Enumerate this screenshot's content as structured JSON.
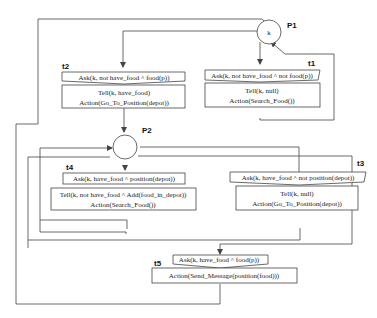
{
  "places": [
    {
      "id": "P1",
      "label": "P1",
      "token": "k"
    },
    {
      "id": "P2",
      "label": "P2",
      "token": ""
    }
  ],
  "transitions": [
    {
      "id": "t1",
      "label": "t1",
      "ask": "Ask(k, not have_food ^ not food(p))",
      "tell": "Tell(k, null)",
      "action": "Action(Search_Food())"
    },
    {
      "id": "t2",
      "label": "t2",
      "ask": "Ask(k, not have_food ^ food(p))",
      "tell": "Tell(k, have_food)",
      "action": "Action(Go_To_Position(depot))"
    },
    {
      "id": "t3",
      "label": "t3",
      "ask": "Ask(k, have_food ^ not position(depot))",
      "tell": "Tell(k, null)",
      "action": "Action(Go_To_Position(depot))"
    },
    {
      "id": "t4",
      "label": "t4",
      "ask": "Ask(k, have_food ^ position(depot))",
      "tell": "Tell(k, not have_food ^ Add(food_in_depot))",
      "action": "Action(Search_Food())"
    },
    {
      "id": "t5",
      "label": "t5",
      "ask": "Ask(k, have_food ^ food(p))",
      "tell": "",
      "action": "Action(Send_Message(position(food)))"
    }
  ]
}
